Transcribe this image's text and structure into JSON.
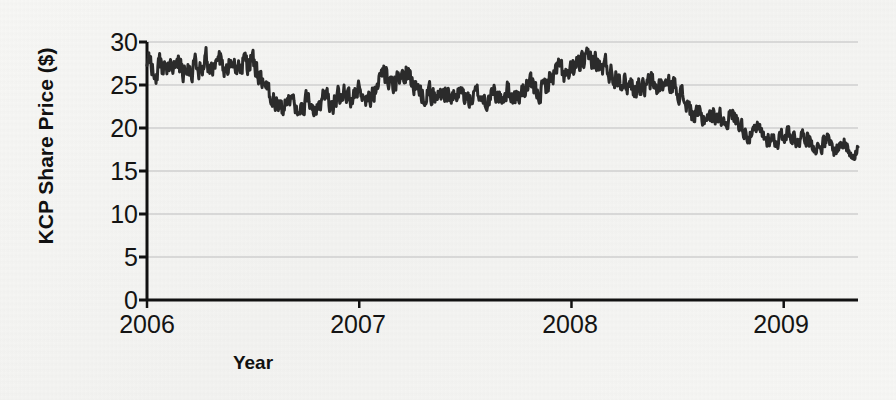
{
  "chart_data": {
    "type": "line",
    "title": "",
    "subtitle": "",
    "xlabel": "Year",
    "ylabel": "KCP Share Price ($)",
    "xlim": [
      2006.0,
      2009.35
    ],
    "ylim": [
      0,
      30
    ],
    "grid": "horizontal",
    "legend": "none",
    "x_tick_labels": [
      "2006",
      "2007",
      "2008",
      "2009"
    ],
    "x_tick_values": [
      2006,
      2007,
      2008,
      2009
    ],
    "y_tick_labels": [
      "0",
      "5",
      "10",
      "15",
      "20",
      "25",
      "30"
    ],
    "y_tick_values": [
      0,
      5,
      10,
      15,
      20,
      25,
      30
    ],
    "line_color": "#2b2b2b",
    "grid_color": "#cfcfcf",
    "axis_color": "#111111",
    "series": [
      {
        "name": "KCP Share Price",
        "x": [
          2006.0,
          2006.01,
          2006.02,
          2006.03,
          2006.04,
          2006.05,
          2006.06,
          2006.07,
          2006.08,
          2006.09,
          2006.1,
          2006.11,
          2006.12,
          2006.13,
          2006.14,
          2006.15,
          2006.16,
          2006.17,
          2006.18,
          2006.19,
          2006.2,
          2006.21,
          2006.22,
          2006.23,
          2006.24,
          2006.25,
          2006.26,
          2006.27,
          2006.28,
          2006.29,
          2006.3,
          2006.31,
          2006.32,
          2006.33,
          2006.34,
          2006.35,
          2006.36,
          2006.37,
          2006.38,
          2006.39,
          2006.4,
          2006.41,
          2006.42,
          2006.43,
          2006.44,
          2006.45,
          2006.46,
          2006.47,
          2006.48,
          2006.49,
          2006.5,
          2006.51,
          2006.52,
          2006.53,
          2006.54,
          2006.55,
          2006.56,
          2006.57,
          2006.58,
          2006.59,
          2006.6,
          2006.62,
          2006.64,
          2006.66,
          2006.68,
          2006.7,
          2006.72,
          2006.74,
          2006.76,
          2006.78,
          2006.8,
          2006.82,
          2006.84,
          2006.86,
          2006.88,
          2006.9,
          2006.92,
          2006.94,
          2006.96,
          2006.98,
          2007.0,
          2007.02,
          2007.04,
          2007.06,
          2007.08,
          2007.1,
          2007.12,
          2007.14,
          2007.16,
          2007.18,
          2007.2,
          2007.22,
          2007.24,
          2007.26,
          2007.28,
          2007.3,
          2007.32,
          2007.34,
          2007.36,
          2007.38,
          2007.4,
          2007.42,
          2007.44,
          2007.46,
          2007.48,
          2007.5,
          2007.52,
          2007.54,
          2007.56,
          2007.58,
          2007.6,
          2007.62,
          2007.64,
          2007.66,
          2007.68,
          2007.7,
          2007.72,
          2007.74,
          2007.76,
          2007.78,
          2007.8,
          2007.82,
          2007.84,
          2007.86,
          2007.88,
          2007.9,
          2007.92,
          2007.94,
          2007.96,
          2007.98,
          2008.0,
          2008.02,
          2008.04,
          2008.06,
          2008.08,
          2008.1,
          2008.12,
          2008.14,
          2008.16,
          2008.18,
          2008.2,
          2008.22,
          2008.24,
          2008.26,
          2008.28,
          2008.3,
          2008.32,
          2008.34,
          2008.36,
          2008.38,
          2008.4,
          2008.42,
          2008.44,
          2008.46,
          2008.48,
          2008.5,
          2008.52,
          2008.54,
          2008.56,
          2008.58,
          2008.6,
          2008.62,
          2008.64,
          2008.66,
          2008.68,
          2008.7,
          2008.72,
          2008.74,
          2008.76,
          2008.78,
          2008.8,
          2008.82,
          2008.84,
          2008.86,
          2008.88,
          2008.9,
          2008.92,
          2008.94,
          2008.96,
          2008.98,
          2009.0,
          2009.02,
          2009.04,
          2009.06,
          2009.08,
          2009.1,
          2009.12,
          2009.14,
          2009.16,
          2009.18,
          2009.2,
          2009.22,
          2009.24,
          2009.26,
          2009.28,
          2009.3,
          2009.32,
          2009.35
        ],
        "values": [
          27.6,
          27.9,
          27.2,
          26.6,
          26.2,
          26.9,
          27.4,
          27.0,
          26.6,
          27.1,
          27.6,
          28.2,
          27.4,
          26.9,
          27.3,
          27.7,
          27.1,
          26.7,
          27.2,
          27.6,
          27.1,
          26.8,
          27.3,
          27.8,
          27.3,
          26.9,
          27.4,
          27.9,
          28.1,
          27.5,
          27.0,
          26.3,
          26.9,
          27.5,
          28.0,
          27.6,
          27.0,
          26.4,
          26.9,
          27.4,
          27.8,
          27.3,
          26.8,
          27.2,
          27.7,
          28.1,
          27.7,
          27.2,
          27.5,
          27.9,
          27.4,
          26.9,
          26.3,
          25.6,
          25.0,
          24.6,
          25.1,
          24.4,
          23.8,
          23.2,
          23.6,
          22.8,
          22.2,
          22.8,
          23.4,
          22.6,
          22.0,
          22.7,
          23.3,
          22.7,
          22.1,
          23.0,
          23.8,
          23.2,
          22.9,
          23.6,
          24.3,
          23.7,
          23.1,
          23.8,
          24.5,
          24.0,
          23.4,
          24.1,
          24.8,
          25.4,
          26.1,
          25.3,
          24.6,
          25.2,
          25.9,
          26.6,
          25.8,
          25.1,
          24.4,
          23.8,
          24.4,
          23.9,
          23.4,
          23.9,
          24.4,
          23.8,
          23.3,
          23.7,
          24.2,
          23.6,
          23.1,
          23.6,
          24.1,
          23.5,
          23.0,
          23.5,
          24.0,
          23.4,
          23.9,
          24.4,
          23.8,
          23.4,
          23.9,
          24.5,
          25.1,
          24.4,
          23.9,
          24.4,
          25.0,
          25.7,
          26.4,
          27.1,
          26.4,
          25.8,
          26.4,
          27.1,
          27.8,
          27.2,
          27.9,
          28.2,
          27.5,
          26.8,
          27.3,
          26.6,
          25.9,
          26.4,
          25.6,
          24.9,
          25.3,
          24.6,
          25.1,
          24.4,
          25.0,
          25.4,
          24.7,
          24.9,
          25.2,
          24.8,
          25.1,
          24.6,
          23.8,
          22.9,
          22.0,
          21.2,
          21.7,
          21.0,
          21.5,
          21.1,
          21.6,
          21.3,
          20.8,
          21.2,
          21.5,
          21.0,
          20.3,
          19.6,
          19.0,
          19.4,
          19.8,
          19.2,
          18.6,
          19.0,
          18.4,
          18.8,
          19.2,
          19.7,
          19.1,
          18.5,
          18.9,
          19.3,
          18.7,
          18.1,
          17.6,
          18.1,
          18.6,
          18.0,
          17.4,
          17.9,
          18.3,
          17.7,
          17.2,
          17.6
        ]
      }
    ],
    "notes": [
      "Share price begins near 27-28 in early 2006 and trends sharply downward to roughly 7 by mid 2009.",
      "Local peak of about 28 in mid 2007; secondary peak of about 20 in early-mid 2008 and about 18 in late 2008.",
      "Steep collapse in late 2008 from about 18 down to about 6, then range-bound between 5 and 9 through 2009."
    ]
  },
  "series_detail": {
    "name": "KCP Share Price",
    "segments": [
      {
        "label": "2006 plateau",
        "range": "2006.00-2006.52",
        "value_range": [
          26.2,
          28.2
        ]
      },
      {
        "label": "mid-2006 decline",
        "range": "2006.52-2006.70",
        "value_range": [
          22.0,
          25.6
        ]
      },
      {
        "label": "2006 H2 recovery",
        "range": "2006.70-2007.20",
        "value_range": [
          22.0,
          26.6
        ]
      },
      {
        "label": "2007 sideways",
        "range": "2007.20-2007.80",
        "value_range": [
          23.0,
          24.5
        ]
      },
      {
        "label": "2007 peak",
        "range": "2007.80-2008.05",
        "value_range": [
          25.0,
          28.2
        ]
      },
      {
        "label": "2007 H2 slide",
        "range": "2008.05-2008.45",
        "value_range": [
          19.0,
          26.0
        ]
      },
      {
        "label": "2008 step down",
        "range": "2008.45-2008.70",
        "value_range": [
          14.5,
          21.0
        ]
      },
      {
        "label": "2008 mid rally",
        "range": "2008.70-2008.82",
        "value_range": [
          15.0,
          20.0
        ]
      },
      {
        "label": "late 2008 rally",
        "range": "2008.82-2008.94",
        "value_range": [
          15.0,
          18.0
        ]
      },
      {
        "label": "crash",
        "range": "2008.94-2009.02",
        "value_range": [
          6.0,
          18.0
        ]
      },
      {
        "label": "2009 base",
        "range": "2009.02-2009.35",
        "value_range": [
          5.2,
          9.0
        ]
      }
    ]
  },
  "axes": {
    "y_title": "KCP Share Price ($)",
    "x_title": "Year",
    "y_ticks": [
      "30",
      "25",
      "20",
      "15",
      "10",
      "5",
      "0"
    ],
    "x_ticks": [
      "2006",
      "2007",
      "2008",
      "2009"
    ]
  },
  "colors": {
    "line": "#2b2b2b",
    "grid": "#cfcfcf",
    "axis": "#111111",
    "background": "#f6f6f4",
    "text": "#141414"
  }
}
